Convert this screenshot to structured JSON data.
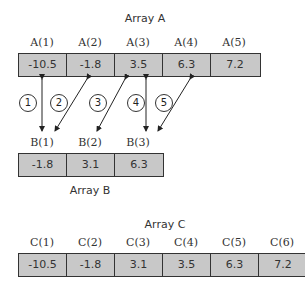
{
  "array_a": {
    "title": "Array A",
    "indices": [
      "A(1)",
      "A(2)",
      "A(3)",
      "A(4)",
      "A(5)"
    ],
    "values": [
      "-10.5",
      "-1.8",
      "3.5",
      "6.3",
      "7.2"
    ]
  },
  "array_b": {
    "title": "Array B",
    "indices": [
      "B(1)",
      "B(2)",
      "B(3)"
    ],
    "values": [
      "-1.8",
      "3.1",
      "6.3"
    ]
  },
  "array_c": {
    "title": "Array C",
    "indices": [
      "C(1)",
      "C(2)",
      "C(3)",
      "C(4)",
      "C(5)",
      "C(6)"
    ],
    "values": [
      "-10.5",
      "-1.8",
      "3.1",
      "3.5",
      "6.3",
      "7.2"
    ]
  },
  "steps": [
    "1",
    "2",
    "3",
    "4",
    "5"
  ],
  "colors": {
    "cell_fill": "#c8c8c8",
    "border": "#333333"
  }
}
